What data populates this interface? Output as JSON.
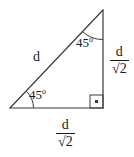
{
  "diagram": {
    "stroke_color": "#3a3a3a",
    "text_color": "#1a1a1a",
    "background_color": "#ffffff",
    "vertices": {
      "left": {
        "x": 10,
        "y": 108
      },
      "top": {
        "x": 103,
        "y": 10
      },
      "right": {
        "x": 103,
        "y": 108
      }
    },
    "labels": {
      "hypotenuse": "d",
      "angle_bottom_left_value": "45",
      "angle_bottom_left_degree": "o",
      "angle_top_value": "45",
      "angle_top_degree": "o",
      "vertical_leg_numerator": "d",
      "vertical_leg_denominator": "√2",
      "horizontal_leg_numerator": "d",
      "horizontal_leg_denominator": "√2"
    },
    "markers": {
      "right_angle": "right-angle-square-with-dot"
    }
  }
}
